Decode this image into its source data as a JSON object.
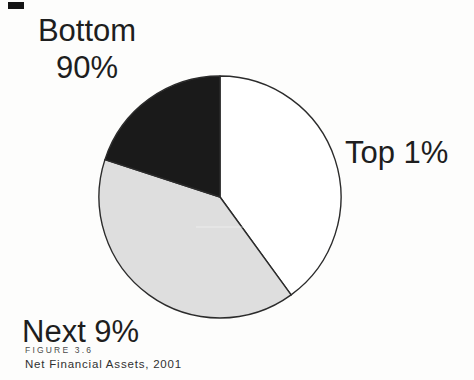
{
  "figure": {
    "number": "FIGURE 3.6",
    "caption": "Net Financial Assets, 2001"
  },
  "chart_data": {
    "type": "pie",
    "title": "Net Financial Assets, 2001",
    "start_angle_deg": 0,
    "direction": "clockwise",
    "legend_position": "callout-labels",
    "outline_color": "#2b2b2b",
    "slices": [
      {
        "label": "Top 1%",
        "value": 40,
        "color": "#ffffff"
      },
      {
        "label": "Next 9%",
        "value": 40,
        "color": "#dedede"
      },
      {
        "label": "Bottom 90%",
        "value": 20,
        "color": "#1a1a1a"
      }
    ]
  }
}
